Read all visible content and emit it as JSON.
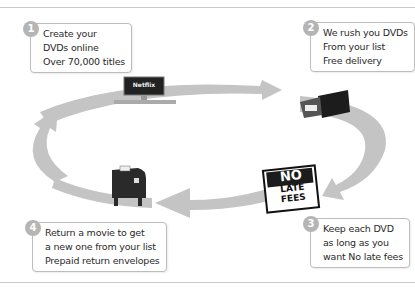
{
  "steps": [
    {
      "number": "1",
      "lines": [
        "Create your",
        "DVDs online",
        "Over 70,000 titles"
      ]
    },
    {
      "number": "2",
      "lines": [
        "We rush you DVDs",
        "From your list",
        "Free delivery"
      ]
    },
    {
      "number": "3",
      "lines": [
        "Keep each DVD",
        "as long as you",
        "want No late fees"
      ]
    },
    {
      "number": "4",
      "lines": [
        "Return a movie to get",
        "a new one from your list",
        "Prepaid return envelopes"
      ]
    }
  ],
  "illustrations": {
    "computer_screen_text": "Netflix",
    "sign": {
      "line1": "NO",
      "line2": "LATE",
      "line3": "FEES"
    }
  },
  "colors": {
    "arrow": "#c4c4c4",
    "badge": "#b5b5b5",
    "border": "#bdbdbd",
    "dark": "#1c1c1c"
  }
}
